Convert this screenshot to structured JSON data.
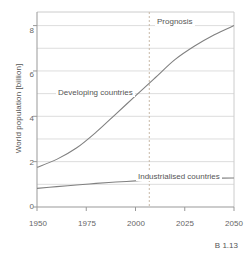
{
  "chart_data": {
    "type": "line",
    "title": "",
    "xlabel": "",
    "ylabel": "World population [billion]",
    "xlim": [
      1950,
      2050
    ],
    "ylim": [
      0,
      8.6
    ],
    "xticks": [
      "1950",
      "1975",
      "2000",
      "2025",
      "2050"
    ],
    "xtick_values": [
      1950,
      1975,
      2000,
      2025,
      2050
    ],
    "yticks": [
      "0",
      "2",
      "4",
      "6",
      "8"
    ],
    "ytick_values": [
      0,
      2,
      4,
      6,
      8
    ],
    "grid": "horizontal-every-1-unit",
    "legend": "inline-labels",
    "annotations": [
      {
        "text": "Prognosis",
        "x": 2012,
        "y": 8.3
      },
      {
        "text": "Developing countries",
        "x": 1975,
        "y": 5.15
      },
      {
        "text": "Industrialised countries",
        "x": 2028,
        "y": 1.75
      }
    ],
    "prognosis_divider": {
      "x": 2007,
      "style": "dashed",
      "color": "#c9b9a8"
    },
    "x": [
      1950,
      1960,
      1970,
      1980,
      1990,
      2000,
      2010,
      2020,
      2030,
      2040,
      2050
    ],
    "series": [
      {
        "name": "Developing countries",
        "color": "#808080",
        "values": [
          1.75,
          2.1,
          2.6,
          3.3,
          4.1,
          4.9,
          5.7,
          6.5,
          7.1,
          7.6,
          8.0
        ]
      },
      {
        "name": "Industrialised countries",
        "color": "#808080",
        "values": [
          0.82,
          0.9,
          0.97,
          1.04,
          1.1,
          1.15,
          1.2,
          1.23,
          1.26,
          1.27,
          1.28
        ]
      }
    ]
  },
  "axis": {
    "y_title": "World population [billion]",
    "y_ticks": [
      "8",
      "6",
      "4",
      "2",
      "0"
    ],
    "x_ticks": [
      "1950",
      "1975",
      "2000",
      "2025",
      "2050"
    ]
  },
  "labels": {
    "prognosis": "Prognosis",
    "developing": "Developing countries",
    "industrialised": "Industrialised countries"
  },
  "caption": {
    "text": "B 1.13"
  },
  "colors": {
    "line": "#808080",
    "grid": "#dddddd",
    "frame": "#cccccc",
    "divider": "#cbbba9",
    "text": "#555555"
  }
}
